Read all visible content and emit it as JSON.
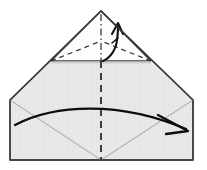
{
  "figure": {
    "type": "instructional-fold-diagram",
    "canvas": {
      "width": 207,
      "height": 170
    },
    "colors": {
      "paper_fill": "#e8e8e8",
      "paper_fill_upper": "#ececec",
      "outline": "#3a3a3a",
      "soft_crease": "#b4b4b4",
      "fold_line": "#303030",
      "arrow": "#111111",
      "background": "#ffffff"
    },
    "geometry": {
      "apex": {
        "x": 101,
        "y": 11
      },
      "left_shoulder": {
        "x": 10,
        "y": 100
      },
      "right_shoulder": {
        "x": 193,
        "y": 100
      },
      "left_bottom": {
        "x": 10,
        "y": 160
      },
      "right_bottom": {
        "x": 193,
        "y": 160
      },
      "bottom_center": {
        "x": 101,
        "y": 160
      },
      "horizontal_crease": {
        "x1": 51,
        "y1": 61,
        "x2": 151,
        "y2": 61
      },
      "center_axis": {
        "x": 101,
        "y1": 11,
        "y2": 160
      }
    },
    "elements": [
      {
        "name": "paper-outline",
        "kind": "polygon",
        "label": "Folded paper silhouette"
      },
      {
        "name": "horizontal-crease-line",
        "kind": "solid-line",
        "label": "Horizontal fold edge"
      },
      {
        "name": "hidden-fold-left",
        "kind": "dashed-line",
        "label": "Hidden valley fold, left"
      },
      {
        "name": "hidden-fold-right",
        "kind": "dashed-line",
        "label": "Hidden valley fold, right"
      },
      {
        "name": "center-axis-upper",
        "kind": "dash-dot-line",
        "label": "Center symmetry axis, upper"
      },
      {
        "name": "center-axis-lower",
        "kind": "dashed-line",
        "label": "Center symmetry axis, lower"
      },
      {
        "name": "soft-crease-left",
        "kind": "soft-line",
        "label": "Existing crease from left corner"
      },
      {
        "name": "soft-crease-right",
        "kind": "soft-line",
        "label": "Existing crease from right corner"
      },
      {
        "name": "small-fold-arrow",
        "kind": "curved-arrow",
        "label": "Small upward fold-up arrow at apex"
      },
      {
        "name": "large-fold-arrow",
        "kind": "curved-arrow",
        "label": "Large left-to-right sweeping fold arrow"
      }
    ],
    "step_number": "",
    "caption": ""
  }
}
